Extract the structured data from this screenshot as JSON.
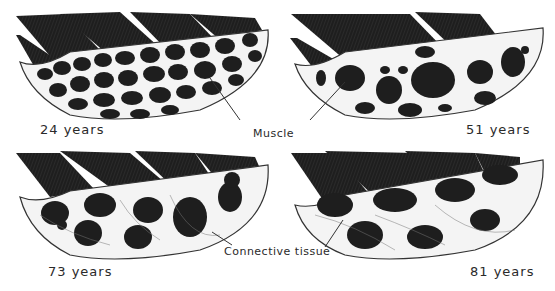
{
  "figure": {
    "panels": [
      {
        "id": "p24",
        "age_label": "24 years",
        "fiber_density": "dense"
      },
      {
        "id": "p51",
        "age_label": "51 years",
        "fiber_density": "moderate"
      },
      {
        "id": "p73",
        "age_label": "73 years",
        "fiber_density": "sparse"
      },
      {
        "id": "p81",
        "age_label": "81 years",
        "fiber_density": "very-sparse"
      }
    ],
    "annotations": {
      "muscle": "Muscle",
      "connective_tissue": "Connective tissue"
    },
    "colors": {
      "background": "#ffffff",
      "muscle_fiber": "#1e1e1e",
      "connective": "#f4f4f4",
      "line": "#333333"
    }
  }
}
